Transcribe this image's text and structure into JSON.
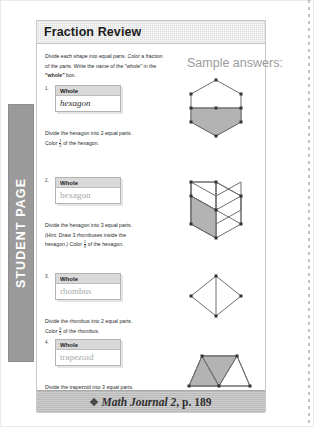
{
  "tab": {
    "label": "STUDENT PAGE"
  },
  "worksheet": {
    "title": "Fraction Review",
    "instructions_part1": "Divide each shape into equal parts. Color a fraction of the parts. Write the name of the ",
    "instructions_quote1": "\"whole\"",
    "instructions_part2": " in the ",
    "instructions_bold": "\"whole\"",
    "instructions_part3": " box.",
    "sample_label": "Sample answers:",
    "whole_header": "Whole",
    "problems": [
      {
        "number": "1.",
        "whole_value": "hexagon",
        "whole_style": "handwritten",
        "line1": "Divide the hexagon into 2 equal parts.",
        "line2_pre": "Color ",
        "fraction_num": "1",
        "fraction_den": "2",
        "line2_post": " of the hexagon."
      },
      {
        "number": "2.",
        "whole_value": "hexagon",
        "whole_style": "faded",
        "line1": "Divide the hexagon into 3 equal parts.",
        "line2": "(Hint: Draw 3 rhombuses inside the",
        "line3_pre": "hexagon.) Color ",
        "fraction_num": "1",
        "fraction_den": "3",
        "line3_post": " of the hexagon."
      },
      {
        "number": "3.",
        "whole_value": "rhombus",
        "whole_style": "faded",
        "line1": "Divide the rhombus into 2 equal parts.",
        "line2_pre": "Color ",
        "fraction_num": "0",
        "fraction_den": "2",
        "line2_post": " of the rhombus."
      },
      {
        "number": "4.",
        "whole_value": "trapezoid",
        "whole_style": "faded",
        "line1": "Divide the trapezoid into 3 equal parts.",
        "line2_pre": "Color ",
        "fraction_num": "2",
        "fraction_den": "3",
        "line2_post": " of the trapezoid."
      }
    ]
  },
  "footer": {
    "title_italic": "Math Journal 2",
    "title_rest": ", p. 189",
    "diamond": "diamond-bullet"
  },
  "colors": {
    "shade_fill": "#b3b3b3",
    "shape_stroke": "#6e6e6e",
    "vertex": "#333333",
    "tab_bg": "#9a9a9a",
    "title_bar": "#dcdcdc",
    "footer_bg": "#b9b9b9",
    "faded_text": "#a9a9a9"
  }
}
